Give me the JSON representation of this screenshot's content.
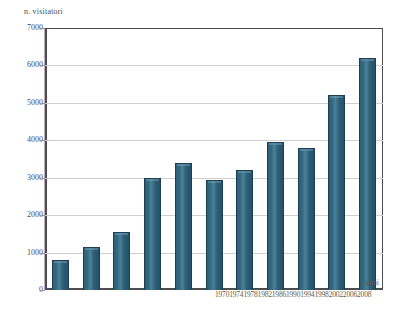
{
  "chart_data": {
    "type": "bar",
    "title": "",
    "xlabel": "anni",
    "ylabel": "n. visitatori",
    "categories": [
      "1970",
      "1974",
      "1978",
      "1982",
      "1986",
      "1990",
      "1994",
      "1998",
      "2002",
      "2006",
      "2008"
    ],
    "values": [
      800,
      1150,
      1550,
      3000,
      3400,
      2950,
      3200,
      3950,
      3800,
      5200,
      6200
    ],
    "ylim": [
      0,
      7000
    ],
    "yticks": [
      "0",
      "1000",
      "2000",
      "3000",
      "4000",
      "5000",
      "6000",
      "7000"
    ],
    "ytick_values": [
      0,
      1000,
      2000,
      3000,
      4000,
      5000,
      6000,
      7000
    ],
    "grid": true,
    "legend": "none",
    "series": [
      {
        "name": "n. visitatori",
        "values": [
          800,
          1150,
          1550,
          3000,
          3400,
          2950,
          3200,
          3950,
          3800,
          5200,
          6200
        ]
      }
    ],
    "colors": {
      "bar_fill": "#34697f",
      "bar_edge": "#1d3f54",
      "bar_highlight": "#6f9ab0",
      "grid": "#cfcfcf",
      "axis": "#4d4d4d",
      "ytick_text": "#4a4a5e",
      "xtick_text": "#6a5a3a",
      "background": "#ffffff"
    }
  }
}
